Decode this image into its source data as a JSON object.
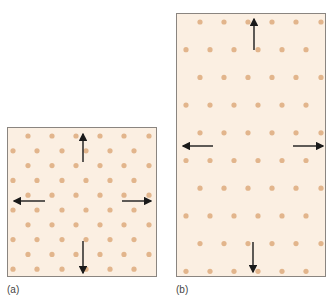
{
  "figure": {
    "panels": [
      {
        "id": "a",
        "label": "(a)",
        "box": {
          "x": 7,
          "y": 127,
          "w": 150,
          "h": 150
        },
        "rows": {
          "count": 10,
          "y0": 8,
          "dy": 14.8
        },
        "odd_row_x": [
          20,
          44,
          68,
          92,
          116,
          141
        ],
        "even_row_x": [
          5,
          29,
          54,
          78,
          102,
          126
        ],
        "arrows": [
          {
            "dir": "up",
            "x1": 75,
            "y1": 34,
            "x2": 75,
            "y2": 6
          },
          {
            "dir": "left",
            "x1": 37,
            "y1": 73,
            "x2": 6,
            "y2": 73
          },
          {
            "dir": "right",
            "x1": 114,
            "y1": 73,
            "x2": 143,
            "y2": 73
          },
          {
            "dir": "down",
            "x1": 75,
            "y1": 113,
            "x2": 75,
            "y2": 145
          }
        ]
      },
      {
        "id": "b",
        "label": "(b)",
        "box": {
          "x": 176,
          "y": 13,
          "w": 150,
          "h": 264
        },
        "rows": {
          "count": 10,
          "y0": 8,
          "dy": 27.7
        },
        "odd_row_x": [
          23,
          47,
          71,
          95,
          119,
          144
        ],
        "even_row_x": [
          9,
          33,
          57,
          81,
          105,
          129
        ],
        "arrows": [
          {
            "dir": "up",
            "x1": 77,
            "y1": 36,
            "x2": 77,
            "y2": 5
          },
          {
            "dir": "left",
            "x1": 36,
            "y1": 132,
            "x2": 6,
            "y2": 132
          },
          {
            "dir": "right",
            "x1": 116,
            "y1": 132,
            "x2": 146,
            "y2": 132
          },
          {
            "dir": "down",
            "x1": 76,
            "y1": 228,
            "x2": 76,
            "y2": 258
          }
        ]
      }
    ],
    "colors": {
      "background": "#fbefe2",
      "dot": "#e2b58c",
      "arrow": "#1a1a1a",
      "border": "#8a8580"
    }
  }
}
